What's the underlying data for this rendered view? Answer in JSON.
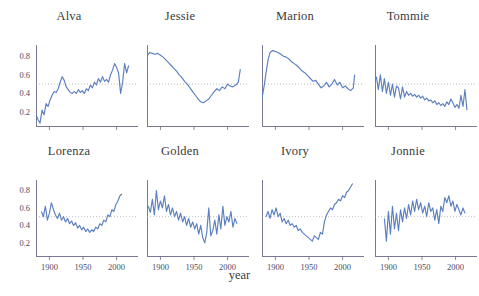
{
  "figure": {
    "type": "small-multiples",
    "rows": 2,
    "cols": 4,
    "xlabel": "year",
    "width": 479,
    "height": 296,
    "line_color": "#5B7FC0",
    "axis_color": "#6a6a8a",
    "reference_line_color": "#a0a0a0",
    "reference_line_value": 0.5,
    "background": "#ffffff"
  },
  "chart_data": {
    "type": "line",
    "title": "",
    "subtitle": "",
    "xlabel": "year",
    "ylabel": "",
    "xlim": [
      1880,
      2020
    ],
    "ylim": [
      0.05,
      0.92
    ],
    "xticks": [
      1900,
      1950,
      2000
    ],
    "xticklabels": [
      "1900",
      "1950",
      "2000"
    ],
    "yticks": [
      0.2,
      0.4,
      0.6,
      0.8
    ],
    "yticklabels": [
      "0.2",
      "0.4",
      "0.6",
      "0.8"
    ],
    "grid": false,
    "legend": "none",
    "annotations": [
      {
        "type": "hline",
        "y": 0.5,
        "style": "dotted",
        "color": "#a0a0a0"
      }
    ],
    "panels": [
      {
        "name": "Alva",
        "row": 0,
        "col": 0,
        "show_ylabels": true,
        "show_xlabels": false,
        "x": [
          1880,
          1883,
          1886,
          1889,
          1892,
          1895,
          1898,
          1901,
          1904,
          1907,
          1910,
          1913,
          1916,
          1919,
          1922,
          1925,
          1928,
          1931,
          1934,
          1937,
          1940,
          1943,
          1946,
          1949,
          1952,
          1955,
          1958,
          1961,
          1964,
          1967,
          1970,
          1973,
          1976,
          1979,
          1982,
          1985,
          1988,
          1991,
          1994,
          1997,
          2000,
          2003,
          2006,
          2009,
          2012,
          2015,
          2018
        ],
        "y": [
          0.17,
          0.12,
          0.08,
          0.22,
          0.17,
          0.29,
          0.26,
          0.33,
          0.38,
          0.42,
          0.41,
          0.45,
          0.52,
          0.58,
          0.54,
          0.47,
          0.44,
          0.41,
          0.4,
          0.42,
          0.4,
          0.44,
          0.41,
          0.43,
          0.4,
          0.45,
          0.43,
          0.49,
          0.46,
          0.52,
          0.49,
          0.56,
          0.52,
          0.58,
          0.53,
          0.55,
          0.52,
          0.6,
          0.65,
          0.72,
          0.68,
          0.62,
          0.4,
          0.52,
          0.72,
          0.62,
          0.7
        ]
      },
      {
        "name": "Jessie",
        "row": 0,
        "col": 1,
        "show_ylabels": false,
        "show_xlabels": false,
        "x": [
          1880,
          1884,
          1888,
          1892,
          1896,
          1900,
          1904,
          1908,
          1912,
          1916,
          1920,
          1924,
          1928,
          1932,
          1936,
          1940,
          1944,
          1948,
          1952,
          1956,
          1960,
          1964,
          1968,
          1972,
          1976,
          1980,
          1984,
          1988,
          1992,
          1996,
          2000,
          2004,
          2008,
          2012,
          2016,
          2019
        ],
        "y": [
          0.8,
          0.84,
          0.83,
          0.82,
          0.83,
          0.81,
          0.79,
          0.76,
          0.73,
          0.7,
          0.67,
          0.64,
          0.6,
          0.57,
          0.53,
          0.5,
          0.46,
          0.42,
          0.38,
          0.34,
          0.31,
          0.3,
          0.32,
          0.34,
          0.38,
          0.42,
          0.45,
          0.43,
          0.47,
          0.45,
          0.5,
          0.48,
          0.47,
          0.49,
          0.52,
          0.66
        ]
      },
      {
        "name": "Marion",
        "row": 0,
        "col": 2,
        "show_ylabels": false,
        "show_xlabels": false,
        "x": [
          1880,
          1883,
          1886,
          1889,
          1892,
          1896,
          1900,
          1904,
          1908,
          1912,
          1916,
          1920,
          1924,
          1928,
          1932,
          1936,
          1940,
          1944,
          1948,
          1952,
          1956,
          1960,
          1964,
          1968,
          1972,
          1976,
          1980,
          1984,
          1988,
          1992,
          1996,
          2000,
          2004,
          2008,
          2012,
          2016,
          2018
        ],
        "y": [
          0.35,
          0.47,
          0.62,
          0.76,
          0.84,
          0.86,
          0.85,
          0.84,
          0.82,
          0.8,
          0.79,
          0.77,
          0.74,
          0.72,
          0.7,
          0.67,
          0.64,
          0.62,
          0.59,
          0.56,
          0.53,
          0.54,
          0.5,
          0.46,
          0.48,
          0.52,
          0.47,
          0.5,
          0.55,
          0.49,
          0.52,
          0.46,
          0.48,
          0.45,
          0.43,
          0.46,
          0.6
        ]
      },
      {
        "name": "Tommie",
        "row": 0,
        "col": 3,
        "show_ylabels": false,
        "show_xlabels": false,
        "x": [
          1882,
          1885,
          1888,
          1891,
          1894,
          1897,
          1900,
          1903,
          1906,
          1909,
          1912,
          1915,
          1918,
          1921,
          1924,
          1927,
          1930,
          1933,
          1936,
          1939,
          1942,
          1945,
          1948,
          1951,
          1954,
          1957,
          1960,
          1963,
          1966,
          1969,
          1972,
          1975,
          1978,
          1981,
          1984,
          1987,
          1990,
          1993,
          1996,
          1999,
          2002,
          2005,
          2008,
          2011,
          2014,
          2017
        ],
        "y": [
          0.58,
          0.44,
          0.6,
          0.42,
          0.56,
          0.4,
          0.52,
          0.38,
          0.5,
          0.36,
          0.48,
          0.46,
          0.34,
          0.47,
          0.36,
          0.42,
          0.38,
          0.4,
          0.37,
          0.39,
          0.36,
          0.38,
          0.35,
          0.37,
          0.33,
          0.35,
          0.32,
          0.33,
          0.3,
          0.32,
          0.28,
          0.3,
          0.27,
          0.29,
          0.26,
          0.31,
          0.28,
          0.34,
          0.3,
          0.25,
          0.28,
          0.24,
          0.38,
          0.26,
          0.44,
          0.22
        ]
      },
      {
        "name": "Lorenza",
        "row": 1,
        "col": 0,
        "show_ylabels": true,
        "show_xlabels": true,
        "x": [
          1888,
          1891,
          1894,
          1897,
          1900,
          1903,
          1906,
          1909,
          1912,
          1915,
          1918,
          1921,
          1924,
          1927,
          1930,
          1933,
          1936,
          1939,
          1942,
          1945,
          1948,
          1951,
          1954,
          1957,
          1960,
          1963,
          1966,
          1969,
          1972,
          1975,
          1978,
          1981,
          1984,
          1987,
          1990,
          1993,
          1996,
          1999,
          2002,
          2005,
          2008
        ],
        "y": [
          0.56,
          0.5,
          0.62,
          0.46,
          0.54,
          0.66,
          0.58,
          0.52,
          0.48,
          0.54,
          0.46,
          0.5,
          0.44,
          0.48,
          0.42,
          0.45,
          0.4,
          0.43,
          0.37,
          0.4,
          0.35,
          0.38,
          0.33,
          0.36,
          0.32,
          0.35,
          0.33,
          0.38,
          0.36,
          0.42,
          0.4,
          0.46,
          0.44,
          0.52,
          0.5,
          0.58,
          0.56,
          0.64,
          0.68,
          0.74,
          0.76
        ]
      },
      {
        "name": "Golden",
        "row": 1,
        "col": 1,
        "show_ylabels": false,
        "show_xlabels": true,
        "x": [
          1882,
          1885,
          1888,
          1891,
          1894,
          1897,
          1900,
          1903,
          1906,
          1909,
          1912,
          1915,
          1918,
          1921,
          1924,
          1927,
          1930,
          1933,
          1936,
          1939,
          1942,
          1945,
          1948,
          1951,
          1954,
          1957,
          1960,
          1963,
          1966,
          1969,
          1972,
          1975,
          1978,
          1981,
          1984,
          1987,
          1990,
          1993,
          1996,
          1999,
          2002,
          2005,
          2008,
          2011,
          2014
        ],
        "y": [
          0.62,
          0.55,
          0.7,
          0.52,
          0.8,
          0.58,
          0.68,
          0.6,
          0.74,
          0.56,
          0.64,
          0.52,
          0.6,
          0.5,
          0.56,
          0.46,
          0.54,
          0.44,
          0.5,
          0.4,
          0.48,
          0.38,
          0.44,
          0.36,
          0.42,
          0.3,
          0.4,
          0.26,
          0.2,
          0.32,
          0.6,
          0.28,
          0.34,
          0.46,
          0.3,
          0.52,
          0.36,
          0.62,
          0.4,
          0.5,
          0.44,
          0.56,
          0.38,
          0.48,
          0.42
        ]
      },
      {
        "name": "Ivory",
        "row": 1,
        "col": 2,
        "show_ylabels": false,
        "show_xlabels": true,
        "x": [
          1886,
          1889,
          1892,
          1895,
          1898,
          1901,
          1904,
          1907,
          1910,
          1913,
          1916,
          1919,
          1922,
          1925,
          1928,
          1931,
          1934,
          1937,
          1940,
          1943,
          1946,
          1949,
          1952,
          1955,
          1958,
          1961,
          1964,
          1967,
          1970,
          1973,
          1976,
          1979,
          1982,
          1985,
          1988,
          1991,
          1994,
          1997,
          2000,
          2003,
          2006,
          2009,
          2012,
          2015
        ],
        "y": [
          0.5,
          0.56,
          0.48,
          0.58,
          0.52,
          0.6,
          0.5,
          0.54,
          0.44,
          0.48,
          0.42,
          0.46,
          0.4,
          0.42,
          0.38,
          0.4,
          0.34,
          0.36,
          0.32,
          0.3,
          0.28,
          0.26,
          0.24,
          0.22,
          0.28,
          0.26,
          0.24,
          0.32,
          0.3,
          0.44,
          0.52,
          0.56,
          0.6,
          0.58,
          0.64,
          0.66,
          0.7,
          0.68,
          0.74,
          0.72,
          0.78,
          0.8,
          0.84,
          0.88
        ]
      },
      {
        "name": "Jonnie",
        "row": 1,
        "col": 3,
        "show_ylabels": false,
        "show_xlabels": true,
        "x": [
          1894,
          1897,
          1900,
          1903,
          1906,
          1909,
          1912,
          1915,
          1918,
          1921,
          1924,
          1927,
          1930,
          1933,
          1936,
          1939,
          1942,
          1945,
          1948,
          1951,
          1954,
          1957,
          1960,
          1963,
          1966,
          1969,
          1972,
          1975,
          1978,
          1981,
          1984,
          1987,
          1990,
          1993,
          1996,
          1999,
          2002,
          2005,
          2008,
          2011,
          2014
        ],
        "y": [
          0.48,
          0.22,
          0.56,
          0.3,
          0.62,
          0.36,
          0.54,
          0.34,
          0.58,
          0.44,
          0.6,
          0.48,
          0.64,
          0.52,
          0.68,
          0.56,
          0.7,
          0.58,
          0.66,
          0.54,
          0.62,
          0.5,
          0.66,
          0.56,
          0.6,
          0.46,
          0.58,
          0.42,
          0.62,
          0.56,
          0.72,
          0.66,
          0.74,
          0.62,
          0.68,
          0.56,
          0.64,
          0.58,
          0.52,
          0.6,
          0.54
        ]
      }
    ]
  }
}
